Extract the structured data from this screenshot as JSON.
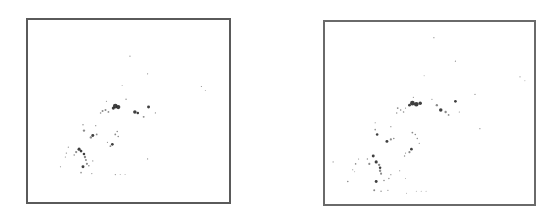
{
  "chart_data": [
    {
      "type": "scatter",
      "title": "",
      "xlabel": "",
      "ylabel": "",
      "grid": false,
      "legend": null,
      "frame": {
        "left": 26,
        "top": 18,
        "width": 205,
        "height": 186
      },
      "point_color": "#2a2a2a",
      "points": [
        {
          "x": 115,
          "y": 106,
          "r": 2.4
        },
        {
          "x": 118,
          "y": 107,
          "r": 2.2
        },
        {
          "x": 113,
          "y": 108,
          "r": 1.6
        },
        {
          "x": 102,
          "y": 111,
          "r": 1.0
        },
        {
          "x": 105,
          "y": 110,
          "r": 1.0
        },
        {
          "x": 108,
          "y": 112,
          "r": 0.9
        },
        {
          "x": 100,
          "y": 113,
          "r": 0.8
        },
        {
          "x": 135,
          "y": 112,
          "r": 1.8
        },
        {
          "x": 138,
          "y": 113,
          "r": 1.3
        },
        {
          "x": 149,
          "y": 107,
          "r": 1.5
        },
        {
          "x": 144,
          "y": 117,
          "r": 1.0
        },
        {
          "x": 126,
          "y": 99,
          "r": 0.7
        },
        {
          "x": 106,
          "y": 101,
          "r": 0.6
        },
        {
          "x": 156,
          "y": 113,
          "r": 0.6
        },
        {
          "x": 130,
          "y": 55,
          "r": 0.6
        },
        {
          "x": 148,
          "y": 73,
          "r": 0.6
        },
        {
          "x": 122,
          "y": 85,
          "r": 0.5
        },
        {
          "x": 203,
          "y": 86,
          "r": 0.6
        },
        {
          "x": 207,
          "y": 90,
          "r": 0.5
        },
        {
          "x": 82,
          "y": 125,
          "r": 0.7
        },
        {
          "x": 83,
          "y": 131,
          "r": 1.2
        },
        {
          "x": 95,
          "y": 126,
          "r": 0.6
        },
        {
          "x": 92,
          "y": 136,
          "r": 1.5
        },
        {
          "x": 90,
          "y": 138,
          "r": 1.2
        },
        {
          "x": 96,
          "y": 135,
          "r": 0.9
        },
        {
          "x": 117,
          "y": 132,
          "r": 0.8
        },
        {
          "x": 115,
          "y": 135,
          "r": 0.9
        },
        {
          "x": 118,
          "y": 137,
          "r": 0.8
        },
        {
          "x": 112,
          "y": 145,
          "r": 1.4
        },
        {
          "x": 110,
          "y": 147,
          "r": 0.9
        },
        {
          "x": 107,
          "y": 143,
          "r": 0.6
        },
        {
          "x": 78,
          "y": 150,
          "r": 1.6
        },
        {
          "x": 80,
          "y": 152,
          "r": 1.4
        },
        {
          "x": 75,
          "y": 153,
          "r": 1.1
        },
        {
          "x": 83,
          "y": 155,
          "r": 1.3
        },
        {
          "x": 84,
          "y": 158,
          "r": 1.2
        },
        {
          "x": 85,
          "y": 161,
          "r": 1.0
        },
        {
          "x": 86,
          "y": 165,
          "r": 1.1
        },
        {
          "x": 73,
          "y": 156,
          "r": 0.8
        },
        {
          "x": 65,
          "y": 154,
          "r": 0.7
        },
        {
          "x": 64,
          "y": 158,
          "r": 0.6
        },
        {
          "x": 67,
          "y": 148,
          "r": 0.6
        },
        {
          "x": 82,
          "y": 168,
          "r": 1.5
        },
        {
          "x": 88,
          "y": 167,
          "r": 0.8
        },
        {
          "x": 92,
          "y": 162,
          "r": 0.6
        },
        {
          "x": 80,
          "y": 174,
          "r": 0.8
        },
        {
          "x": 91,
          "y": 175,
          "r": 0.6
        },
        {
          "x": 59,
          "y": 168,
          "r": 0.6
        },
        {
          "x": 148,
          "y": 160,
          "r": 0.6
        },
        {
          "x": 115,
          "y": 176,
          "r": 0.6
        },
        {
          "x": 120,
          "y": 176,
          "r": 0.5
        },
        {
          "x": 125,
          "y": 176,
          "r": 0.5
        }
      ]
    },
    {
      "type": "scatter",
      "title": "",
      "xlabel": "",
      "ylabel": "",
      "grid": false,
      "legend": null,
      "frame": {
        "left": 323,
        "top": 20,
        "width": 213,
        "height": 186
      },
      "point_color": "#2a2a2a",
      "points": [
        {
          "x": 412,
          "y": 103,
          "r": 2.4
        },
        {
          "x": 416,
          "y": 104,
          "r": 2.3
        },
        {
          "x": 420,
          "y": 103,
          "r": 1.8
        },
        {
          "x": 409,
          "y": 105,
          "r": 1.4
        },
        {
          "x": 397,
          "y": 108,
          "r": 0.9
        },
        {
          "x": 400,
          "y": 110,
          "r": 0.8
        },
        {
          "x": 403,
          "y": 112,
          "r": 0.8
        },
        {
          "x": 396,
          "y": 113,
          "r": 0.7
        },
        {
          "x": 405,
          "y": 108,
          "r": 0.6
        },
        {
          "x": 437,
          "y": 105,
          "r": 1.2
        },
        {
          "x": 441,
          "y": 110,
          "r": 1.8
        },
        {
          "x": 446,
          "y": 112,
          "r": 1.2
        },
        {
          "x": 456,
          "y": 101,
          "r": 1.4
        },
        {
          "x": 449,
          "y": 115,
          "r": 0.9
        },
        {
          "x": 432,
          "y": 99,
          "r": 0.6
        },
        {
          "x": 413,
          "y": 97,
          "r": 0.6
        },
        {
          "x": 460,
          "y": 112,
          "r": 0.6
        },
        {
          "x": 434,
          "y": 36,
          "r": 0.6
        },
        {
          "x": 456,
          "y": 60,
          "r": 0.6
        },
        {
          "x": 424,
          "y": 75,
          "r": 0.5
        },
        {
          "x": 522,
          "y": 76,
          "r": 0.6
        },
        {
          "x": 527,
          "y": 80,
          "r": 0.5
        },
        {
          "x": 481,
          "y": 129,
          "r": 0.6
        },
        {
          "x": 476,
          "y": 94,
          "r": 0.6
        },
        {
          "x": 374,
          "y": 123,
          "r": 0.6
        },
        {
          "x": 374,
          "y": 130,
          "r": 0.8
        },
        {
          "x": 376,
          "y": 135,
          "r": 1.3
        },
        {
          "x": 390,
          "y": 127,
          "r": 0.6
        },
        {
          "x": 386,
          "y": 142,
          "r": 1.5
        },
        {
          "x": 390,
          "y": 140,
          "r": 1.1
        },
        {
          "x": 393,
          "y": 139,
          "r": 0.8
        },
        {
          "x": 412,
          "y": 133,
          "r": 0.9
        },
        {
          "x": 415,
          "y": 135,
          "r": 0.8
        },
        {
          "x": 417,
          "y": 139,
          "r": 0.7
        },
        {
          "x": 419,
          "y": 144,
          "r": 0.6
        },
        {
          "x": 411,
          "y": 150,
          "r": 1.4
        },
        {
          "x": 409,
          "y": 153,
          "r": 1.1
        },
        {
          "x": 405,
          "y": 154,
          "r": 0.6
        },
        {
          "x": 404,
          "y": 157,
          "r": 0.7
        },
        {
          "x": 372,
          "y": 157,
          "r": 1.5
        },
        {
          "x": 375,
          "y": 163,
          "r": 1.6
        },
        {
          "x": 368,
          "y": 165,
          "r": 1.1
        },
        {
          "x": 378,
          "y": 166,
          "r": 1.2
        },
        {
          "x": 379,
          "y": 169,
          "r": 1.3
        },
        {
          "x": 379,
          "y": 172,
          "r": 1.2
        },
        {
          "x": 380,
          "y": 175,
          "r": 1.1
        },
        {
          "x": 366,
          "y": 160,
          "r": 0.7
        },
        {
          "x": 354,
          "y": 165,
          "r": 0.8
        },
        {
          "x": 357,
          "y": 160,
          "r": 0.6
        },
        {
          "x": 351,
          "y": 171,
          "r": 0.6
        },
        {
          "x": 353,
          "y": 173,
          "r": 0.5
        },
        {
          "x": 375,
          "y": 183,
          "r": 1.5
        },
        {
          "x": 383,
          "y": 182,
          "r": 0.8
        },
        {
          "x": 388,
          "y": 180,
          "r": 0.7
        },
        {
          "x": 390,
          "y": 176,
          "r": 0.6
        },
        {
          "x": 346,
          "y": 183,
          "r": 0.8
        },
        {
          "x": 331,
          "y": 163,
          "r": 0.6
        },
        {
          "x": 373,
          "y": 192,
          "r": 1.0
        },
        {
          "x": 380,
          "y": 193,
          "r": 0.7
        },
        {
          "x": 387,
          "y": 192,
          "r": 0.6
        },
        {
          "x": 399,
          "y": 172,
          "r": 0.6
        },
        {
          "x": 405,
          "y": 180,
          "r": 0.5
        },
        {
          "x": 406,
          "y": 195,
          "r": 0.5
        },
        {
          "x": 416,
          "y": 193,
          "r": 0.5
        },
        {
          "x": 421,
          "y": 193,
          "r": 0.5
        },
        {
          "x": 426,
          "y": 193,
          "r": 0.5
        }
      ]
    }
  ]
}
